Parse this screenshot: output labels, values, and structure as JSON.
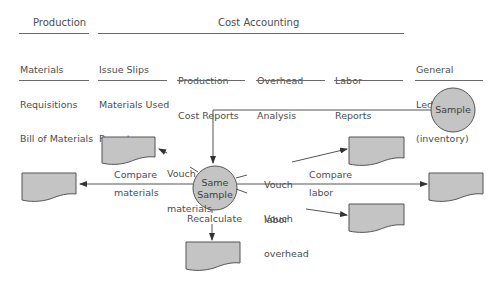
{
  "header": {
    "groups": [
      {
        "label": "Production"
      },
      {
        "label": "Cost Accounting"
      }
    ],
    "columns": [
      {
        "lines": [
          "Materials",
          "Requisitions",
          "Bill of Materials"
        ]
      },
      {
        "lines": [
          "Issue Slips",
          "Materials Used",
          "Reports"
        ]
      },
      {
        "lines": [
          "Production",
          "Cost Reports"
        ]
      },
      {
        "lines": [
          "Overhead",
          "Analysis"
        ]
      },
      {
        "lines": [
          "Labor",
          "Reports"
        ]
      },
      {
        "lines": [
          "General",
          "Ledger",
          "(inventory)"
        ]
      }
    ]
  },
  "nodes": {
    "sample": {
      "label": "Sample"
    },
    "same_sample": {
      "lines": [
        "Same",
        "Sample"
      ]
    }
  },
  "edges": {
    "vouch_materials": [
      "Vouch",
      "materials"
    ],
    "compare_materials": [
      "Compare",
      "materials"
    ],
    "vouch_labor": [
      "Vouch",
      "labor"
    ],
    "compare_labor": [
      "Compare",
      "labor"
    ],
    "vouch_overhead": [
      "Vouch",
      "overhead"
    ],
    "recalculate": "Recalculate"
  },
  "colors": {
    "fill": "#c4c4c4",
    "stroke": "#555555",
    "text": "#4d4d4d"
  }
}
